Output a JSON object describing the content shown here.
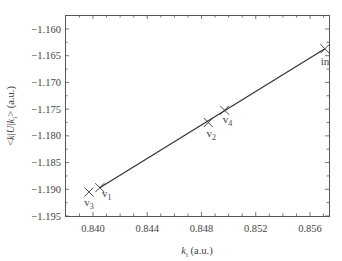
{
  "chart_data": {
    "type": "line",
    "title": "",
    "xlabel": "k_i (a.u.)",
    "ylabel": "<k|U|k_i> (a.u.)",
    "xlim": [
      0.8383,
      0.859
    ],
    "ylim": [
      -1.195,
      -1.158
    ],
    "x_ticks": [
      0.84,
      0.844,
      0.848,
      0.852,
      0.856
    ],
    "x_tick_labels": [
      "0.840",
      "0.844",
      "0.848",
      "0.852",
      "0.856"
    ],
    "y_ticks": [
      -1.16,
      -1.165,
      -1.17,
      -1.175,
      -1.18,
      -1.185,
      -1.19,
      -1.195
    ],
    "y_tick_labels": [
      "-1.160",
      "-1.165",
      "-1.170",
      "-1.175",
      "-1.180",
      "-1.185",
      "-1.190",
      "-1.195"
    ],
    "grid": false,
    "legend": null,
    "series": [
      {
        "name": "line",
        "points": [
          {
            "label": "v3",
            "x": 0.8397,
            "y": -1.1905
          },
          {
            "label": "v1",
            "x": 0.8405,
            "y": -1.1897
          },
          {
            "label": "v2",
            "x": 0.8485,
            "y": -1.1775
          },
          {
            "label": "v4",
            "x": 0.8497,
            "y": -1.1752
          },
          {
            "label": "in",
            "x": 0.8571,
            "y": -1.1637
          }
        ]
      }
    ],
    "annotations": [
      "v3",
      "v1",
      "v2",
      "v4",
      "in"
    ]
  }
}
